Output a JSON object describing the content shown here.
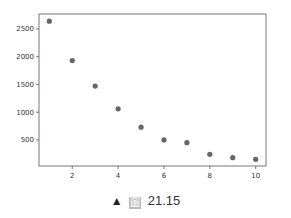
{
  "chart_data": {
    "type": "scatter",
    "title": "",
    "xlabel": "",
    "ylabel": "",
    "x": [
      1,
      2,
      3,
      4,
      5,
      6,
      7,
      8,
      9,
      10
    ],
    "series": [
      {
        "name": "",
        "values": [
          2640,
          1930,
          1470,
          1060,
          730,
          500,
          450,
          240,
          180,
          150
        ],
        "color": "#666666"
      }
    ],
    "xticks": [
      2,
      4,
      6,
      8,
      10
    ],
    "yticks": [
      500,
      1000,
      1500,
      2000,
      2500
    ],
    "xlim": [
      0.55,
      10.45
    ],
    "ylim": [
      30,
      2770
    ],
    "grid": false,
    "legend": null
  },
  "caption": {
    "marker": "▲",
    "figure_glyph": "圖",
    "number": "21.15"
  }
}
